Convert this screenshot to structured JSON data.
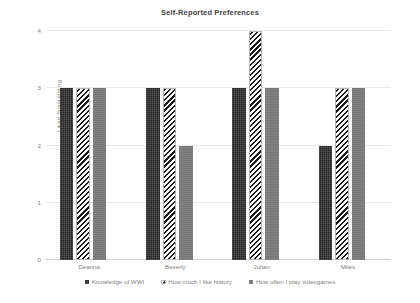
{
  "chart_data": {
    "type": "bar",
    "title": "Self-Reported Preferences",
    "xlabel": "",
    "ylabel": "Likert Scale Rating",
    "categories": [
      "Deanna",
      "Beverly",
      "Julian",
      "Miles"
    ],
    "series": [
      {
        "name": "Knowledge of WWI",
        "values": [
          3,
          3,
          3,
          2
        ],
        "color": "#262626",
        "pattern": "checker"
      },
      {
        "name": "How much I like history",
        "values": [
          3,
          3,
          4,
          3
        ],
        "color": "#1a1a1a",
        "pattern": "diagonal-hatch"
      },
      {
        "name": "How often I play videogames",
        "values": [
          3,
          2,
          3,
          3
        ],
        "color": "#7b7b7b",
        "pattern": "solid-gray"
      }
    ],
    "ylim": [
      0,
      4
    ],
    "yticks": [
      0,
      1,
      2,
      3,
      4
    ],
    "ytick_labels": [
      "0",
      "1",
      "2",
      "3",
      "4"
    ],
    "grid": true,
    "legend_position": "bottom"
  },
  "legend": {
    "items": [
      {
        "label": "Knowledge of WWI"
      },
      {
        "label": "How much I like history"
      },
      {
        "label": "How often I play videogames"
      }
    ]
  }
}
